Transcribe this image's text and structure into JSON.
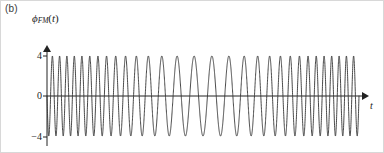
{
  "figure": {
    "panel_label": "(b)",
    "background_color": "#ffffff",
    "border_color": "#d8d8d8",
    "width": 384,
    "height": 153
  },
  "axes": {
    "y_label": "ϕ",
    "y_label_subscript": "FM",
    "y_label_arg_open": "(",
    "y_label_arg": "t",
    "y_label_arg_close": ")",
    "x_label": "t",
    "axis_color": "#222222",
    "y_ticks": [
      {
        "value": 4,
        "label": "4",
        "pixel_y": 55
      },
      {
        "value": 0,
        "label": "0",
        "pixel_y": 95
      },
      {
        "value": -4,
        "label": "−4",
        "pixel_y": 136
      }
    ],
    "origin_pixel": {
      "x": 46,
      "y": 95
    },
    "x_axis_end_pixel": 366,
    "y_axis_top_pixel": 44
  },
  "chart_data": {
    "type": "line",
    "title": "",
    "subtitle": "",
    "xlabel": "t",
    "ylabel": "ϕFM(t)",
    "xlim": [
      0,
      1
    ],
    "ylim": [
      -5.2,
      5.2
    ],
    "grid": false,
    "legend": null,
    "annotations": [],
    "series": [
      {
        "name": "phi_FM(t)",
        "color": "#333333",
        "line_width": 0.9,
        "amplitude": 4,
        "carrier_cycles": 30.5,
        "modulation_index": 13.0,
        "modulation_cycles": 1.0,
        "modulation_phase_deg": 0,
        "carrier_phase_deg": 90,
        "formula": "4 * cos(2*pi*30.5*x + 13.0*sin(2*pi*1.0*x))"
      }
    ],
    "y_tick_values": [
      4,
      0,
      -4
    ],
    "y_tick_labels": [
      "4",
      "0",
      "−4"
    ],
    "x_tick_values": [],
    "x_tick_labels": []
  }
}
